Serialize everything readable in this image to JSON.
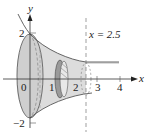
{
  "figure": {
    "axes": {
      "x_label": "x",
      "y_label": "y",
      "x_ticks": [
        "0",
        "1",
        "2",
        "3",
        "4"
      ],
      "y_ticks": [
        "2",
        "−2"
      ]
    },
    "annotation": "x = 2.5",
    "colors": {
      "solid_fill": "#d9d9d9",
      "edge": "#555555",
      "slice": "#9a9a9a",
      "axis": "#333333"
    }
  }
}
